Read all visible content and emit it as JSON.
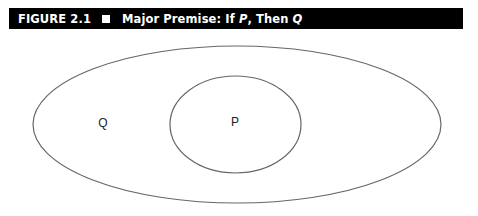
{
  "figure": {
    "number": "FIGURE 2.1",
    "title_prefix": "Major Premise: If ",
    "title_p": "P",
    "title_mid": ", Then ",
    "title_q": "Q",
    "bar_color": "#000000"
  },
  "diagram": {
    "type": "euler-diagram",
    "outer_set": {
      "label": "Q",
      "cx": 237,
      "cy": 124.5,
      "rx": 204,
      "ry": 78.5
    },
    "inner_set": {
      "label": "P",
      "cx": 235.5,
      "cy": 124.5,
      "rx": 65.5,
      "ry": 48.5
    },
    "stroke_color": "#666666"
  }
}
